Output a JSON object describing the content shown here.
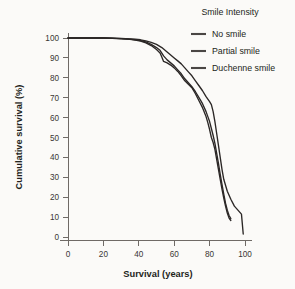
{
  "chart_data": {
    "type": "line",
    "title": "",
    "xlabel": "Survival (years)",
    "ylabel": "Cumulative survival (%)",
    "xlim": [
      0,
      105
    ],
    "ylim": [
      0,
      102
    ],
    "xticks": [
      0,
      20,
      40,
      60,
      80,
      100
    ],
    "yticks": [
      0,
      10,
      20,
      30,
      40,
      50,
      60,
      70,
      80,
      90,
      100
    ],
    "grid": false,
    "legend_position": "top-right",
    "legend_title": "Smile Intensity",
    "line_color": "#2b2726",
    "background_color": "#fbfaf8",
    "axis_color": "#6f6a66",
    "series": [
      {
        "name": "No smile",
        "color": "#2b2726",
        "x": [
          0,
          5,
          10,
          15,
          20,
          25,
          30,
          35,
          38,
          41,
          44,
          47,
          50,
          52,
          53,
          54,
          56,
          58,
          60,
          62,
          64,
          66,
          68,
          70,
          72,
          74,
          76,
          78,
          79,
          80,
          81,
          82,
          83,
          84,
          85,
          86,
          87,
          88,
          89,
          90,
          91,
          92
        ],
        "y": [
          100,
          100,
          100,
          100,
          100,
          99.8,
          99.6,
          99.3,
          99.0,
          98.5,
          97.6,
          96.2,
          94.2,
          92.5,
          90.5,
          88.2,
          87.5,
          86.4,
          85.0,
          83.2,
          81.0,
          78.5,
          76.8,
          75.0,
          72.0,
          68.5,
          65.0,
          60.5,
          57.5,
          54.0,
          50.0,
          47.5,
          44.0,
          39.0,
          34.0,
          29.0,
          24.0,
          19.5,
          15.5,
          12.0,
          9.5,
          8.3
        ]
      },
      {
        "name": "Partial smile",
        "color": "#2b2726",
        "x": [
          0,
          5,
          10,
          15,
          20,
          25,
          30,
          35,
          38,
          41,
          44,
          47,
          50,
          52,
          54,
          56,
          58,
          60,
          62,
          64,
          66,
          68,
          70,
          72,
          74,
          76,
          78,
          79,
          80,
          81,
          82,
          83,
          84,
          85,
          86,
          87,
          88,
          89,
          90,
          91,
          92
        ],
        "y": [
          100,
          100,
          100,
          100,
          100,
          99.9,
          99.7,
          99.4,
          99.1,
          98.7,
          98.0,
          96.8,
          95.2,
          93.8,
          91.0,
          89.0,
          87.5,
          86.0,
          84.0,
          82.0,
          79.5,
          77.5,
          75.5,
          73.0,
          70.0,
          67.0,
          63.0,
          60.5,
          58.0,
          54.5,
          51.0,
          47.0,
          42.0,
          37.0,
          31.5,
          26.5,
          21.5,
          17.0,
          13.5,
          10.8,
          9.2
        ]
      },
      {
        "name": "Duchenne smile",
        "color": "#2b2726",
        "x": [
          0,
          5,
          10,
          15,
          20,
          25,
          30,
          35,
          38,
          41,
          44,
          47,
          50,
          53,
          56,
          58,
          60,
          62,
          64,
          66,
          68,
          70,
          72,
          74,
          76,
          78,
          80,
          81,
          82,
          83,
          84,
          85,
          86,
          87,
          88,
          89,
          90,
          92,
          94,
          96,
          98,
          99
        ],
        "y": [
          100,
          100,
          100,
          100,
          100,
          99.9,
          99.8,
          99.6,
          99.4,
          99.1,
          98.6,
          97.8,
          96.8,
          95.2,
          93.0,
          91.5,
          90.0,
          88.5,
          87.0,
          85.0,
          83.0,
          81.0,
          78.5,
          76.0,
          73.5,
          70.5,
          68.0,
          66.5,
          63.0,
          58.0,
          52.0,
          46.0,
          40.0,
          34.0,
          29.0,
          26.0,
          23.0,
          19.0,
          15.5,
          13.5,
          11.5,
          1.5
        ]
      }
    ]
  },
  "axes": {
    "x_title": "Survival (years)",
    "y_title": "Cumulative survival (%)",
    "x_tick_labels": [
      "0",
      "20",
      "40",
      "60",
      "80",
      "100"
    ],
    "y_tick_labels": [
      "0",
      "10",
      "20",
      "30",
      "40",
      "50",
      "60",
      "70",
      "80",
      "90",
      "100"
    ]
  },
  "legend": {
    "title": "Smile Intensity",
    "items": [
      {
        "label": "No smile"
      },
      {
        "label": "Partial smile"
      },
      {
        "label": "Duchenne smile"
      }
    ]
  }
}
